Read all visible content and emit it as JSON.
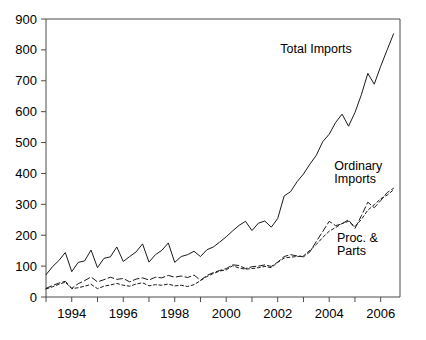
{
  "chart_data": {
    "type": "line",
    "title": "",
    "subtitle": "",
    "xlabel": "",
    "ylabel": "",
    "xlim": [
      1993.0,
      2006.75
    ],
    "ylim": [
      0,
      900
    ],
    "yticks": [
      0,
      100,
      200,
      300,
      400,
      500,
      600,
      700,
      800,
      900
    ],
    "ytick_labels": [
      "0",
      "100",
      "200",
      "300",
      "400",
      "500",
      "600",
      "700",
      "800",
      "900"
    ],
    "xticks": [
      1994,
      1996,
      1998,
      2000,
      2002,
      2004,
      2006
    ],
    "xtick_labels": [
      "1994",
      "1996",
      "1998",
      "2000",
      "2002",
      "2004",
      "2006"
    ],
    "x_minor_ticks": [
      1993,
      1994,
      1995,
      1996,
      1997,
      1998,
      1999,
      2000,
      2001,
      2002,
      2003,
      2004,
      2005,
      2006
    ],
    "grid": false,
    "legend_position": "inline-annotations",
    "x": [
      1993.0,
      1993.25,
      1993.5,
      1993.75,
      1994.0,
      1994.25,
      1994.5,
      1994.75,
      1995.0,
      1995.25,
      1995.5,
      1995.75,
      1996.0,
      1996.25,
      1996.5,
      1996.75,
      1997.0,
      1997.25,
      1997.5,
      1997.75,
      1998.0,
      1998.25,
      1998.5,
      1998.75,
      1999.0,
      1999.25,
      1999.5,
      1999.75,
      2000.0,
      2000.25,
      2000.5,
      2000.75,
      2001.0,
      2001.25,
      2001.5,
      2001.75,
      2002.0,
      2002.25,
      2002.5,
      2002.75,
      2003.0,
      2003.25,
      2003.5,
      2003.75,
      2004.0,
      2004.25,
      2004.5,
      2004.75,
      2005.0,
      2005.25,
      2005.5,
      2005.75,
      2006.0,
      2006.25,
      2006.5
    ],
    "series": [
      {
        "name": "Total Imports",
        "style": "solid",
        "label_text": "Total Imports",
        "values": [
          72,
          98,
          118,
          144,
          82,
          112,
          117,
          152,
          95,
          125,
          130,
          162,
          115,
          131,
          146,
          172,
          113,
          137,
          151,
          175,
          112,
          131,
          137,
          148,
          131,
          153,
          162,
          178,
          195,
          214,
          232,
          245,
          215,
          239,
          246,
          226,
          254,
          327,
          341,
          373,
          398,
          430,
          459,
          503,
          527,
          565,
          592,
          553,
          597,
          655,
          724,
          689,
          747,
          800,
          852
        ]
      },
      {
        "name": "Ordinary Imports",
        "style": "dashed-long",
        "label_text": "Ordinary Imports",
        "values": [
          28,
          37,
          45,
          51,
          28,
          43,
          53,
          65,
          49,
          56,
          64,
          57,
          60,
          49,
          58,
          62,
          55,
          64,
          62,
          70,
          64,
          68,
          63,
          71,
          54,
          70,
          79,
          86,
          92,
          104,
          102,
          92,
          98,
          100,
          104,
          99,
          113,
          131,
          137,
          133,
          130,
          146,
          180,
          212,
          245,
          231,
          237,
          250,
          222,
          263,
          307,
          289,
          312,
          338,
          352
        ]
      },
      {
        "name": "Proc. & Parts",
        "style": "dashed-short",
        "label_text": "Proc. & Parts",
        "values": [
          26,
          33,
          41,
          48,
          27,
          30,
          35,
          41,
          27,
          35,
          39,
          44,
          38,
          35,
          42,
          46,
          36,
          40,
          38,
          42,
          36,
          38,
          34,
          40,
          53,
          66,
          76,
          84,
          88,
          101,
          94,
          90,
          92,
          95,
          99,
          95,
          112,
          126,
          129,
          131,
          133,
          151,
          170,
          193,
          213,
          225,
          238,
          245,
          228,
          251,
          281,
          299,
          318,
          330,
          347
        ]
      }
    ],
    "annotations": [
      {
        "text": "Total Imports",
        "x": 2002.1,
        "y": 790
      },
      {
        "text": "Ordinary",
        "x": 2004.2,
        "y": 412
      },
      {
        "text": "Imports",
        "x": 2004.2,
        "y": 368
      },
      {
        "text": "Proc. &",
        "x": 2004.3,
        "y": 178
      },
      {
        "text": "Parts",
        "x": 2004.3,
        "y": 136
      }
    ],
    "colors": {
      "line": "#1a1a1a",
      "axis": "#4a4a4a",
      "background": "#ffffff",
      "text": "#000000"
    }
  }
}
